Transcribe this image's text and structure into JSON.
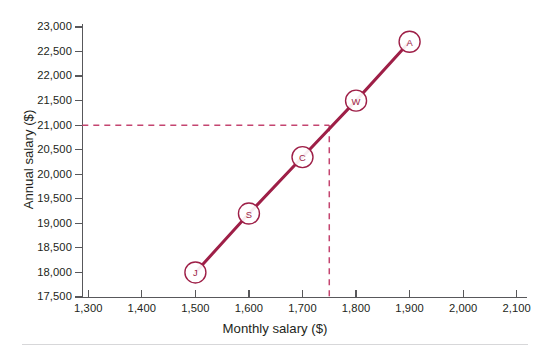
{
  "chart_data": {
    "type": "scatter",
    "title": "",
    "xlabel": "Monthly salary ($)",
    "ylabel": "Annual salary ($)",
    "xlim": [
      1300,
      2100
    ],
    "ylim": [
      17500,
      23000
    ],
    "xticks": [
      "1,300",
      "1,400",
      "1,500",
      "1,600",
      "1,700",
      "1,800",
      "1,900",
      "2,000",
      "2,100"
    ],
    "xtick_values": [
      1300,
      1400,
      1500,
      1600,
      1700,
      1800,
      1900,
      2000,
      2100
    ],
    "yticks": [
      "17,500",
      "18,000",
      "18,500",
      "19,000",
      "19,500",
      "20,000",
      "20,500",
      "21,000",
      "21,500",
      "22,000",
      "22,500",
      "23,000"
    ],
    "ytick_values": [
      17500,
      18000,
      18500,
      19000,
      19500,
      20000,
      20500,
      21000,
      21500,
      22000,
      22500,
      23000
    ],
    "grid": false,
    "legend": "none",
    "series": [
      {
        "name": "Employees",
        "connected": true,
        "line_color": "#9e1f47",
        "points": [
          {
            "label": "J",
            "x": 1500,
            "y": 18000
          },
          {
            "label": "S",
            "x": 1600,
            "y": 19200
          },
          {
            "label": "C",
            "x": 1700,
            "y": 20350
          },
          {
            "label": "W",
            "x": 1800,
            "y": 21500
          },
          {
            "label": "A",
            "x": 1900,
            "y": 22700
          }
        ]
      }
    ],
    "annotations": [
      {
        "name": "reference-lines",
        "type": "dashed-crosshair",
        "x": 1750,
        "y": 21000,
        "color": "#c44570",
        "description": "Dashed guide lines from y = 21,000 across to x = 1,750 and down to the x-axis"
      }
    ]
  },
  "colors": {
    "line": "#9e1f47",
    "marker_stroke": "#9e1f47",
    "marker_fill": "#ffffff",
    "dashed_guide": "#c44570",
    "axis": "#58585b",
    "text": "#231f20",
    "rule": "#d7d7d9",
    "background": "#ffffff"
  }
}
